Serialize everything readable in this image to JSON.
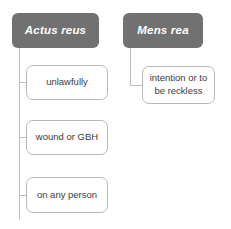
{
  "diagram": {
    "type": "tree",
    "title": "",
    "colors": {
      "header_fill": "#717171",
      "header_text": "#ffffff",
      "leaf_fill": "#ffffff",
      "leaf_border": "#b9b9b9",
      "leaf_text": "#3b3b3b",
      "connector": "#bdbdbd",
      "background": "#ffffff"
    },
    "branches": [
      {
        "id": "actus-reus",
        "header": "Actus reus",
        "children": [
          {
            "id": "unlawfully",
            "label": "unlawfully"
          },
          {
            "id": "wound-or-gbh",
            "label": "wound or GBH"
          },
          {
            "id": "on-any-person",
            "label": "on any person"
          }
        ]
      },
      {
        "id": "mens-rea",
        "header": "Mens rea",
        "children": [
          {
            "id": "intention-or-to-be-reckless",
            "label": "intention or to be reckless"
          }
        ]
      }
    ]
  }
}
